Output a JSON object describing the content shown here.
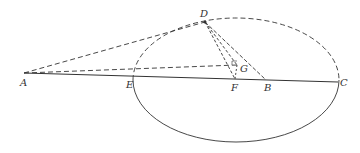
{
  "diagram": {
    "type": "geometry",
    "points": {
      "A": {
        "label": "A",
        "x": 24,
        "y": 73
      },
      "E": {
        "label": "E",
        "x": 134,
        "y": 76
      },
      "F": {
        "label": "F",
        "x": 235,
        "y": 79
      },
      "B": {
        "label": "B",
        "x": 266,
        "y": 80
      },
      "C": {
        "label": "C",
        "x": 338,
        "y": 82
      },
      "D": {
        "label": "D",
        "x": 205,
        "y": 22
      },
      "G": {
        "label": "G",
        "x": 237,
        "y": 65
      }
    },
    "ellipse": {
      "cx": 236,
      "cy": 80,
      "rx": 103,
      "ry": 62
    },
    "solid_segments": [
      [
        "A",
        "C"
      ],
      [
        "D",
        "B"
      ]
    ],
    "dashed_segments": [
      [
        "A",
        "D"
      ],
      [
        "A",
        "G"
      ],
      [
        "D",
        "G"
      ],
      [
        "D",
        "F"
      ],
      [
        "G",
        "F"
      ]
    ],
    "stroke_color": "#333333"
  }
}
